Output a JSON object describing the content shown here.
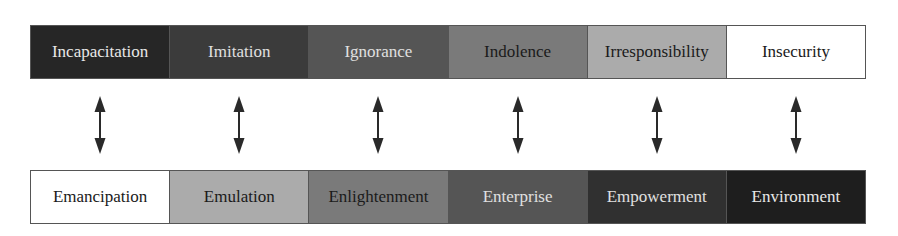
{
  "top_row": {
    "items": [
      {
        "label": "Incapacitation",
        "bg": "#262626",
        "fg": "#e8e8e8"
      },
      {
        "label": "Imitation",
        "bg": "#3b3b3b",
        "fg": "#e0e0e0"
      },
      {
        "label": "Ignorance",
        "bg": "#555555",
        "fg": "#e0e0e0"
      },
      {
        "label": "Indolence",
        "bg": "#7a7a7a",
        "fg": "#1a1a1a"
      },
      {
        "label": "Irresponsibility",
        "bg": "#ababab",
        "fg": "#1a1a1a"
      },
      {
        "label": "Insecurity",
        "bg": "#ffffff",
        "fg": "#1a1a1a"
      }
    ]
  },
  "bottom_row": {
    "items": [
      {
        "label": "Emancipation",
        "bg": "#ffffff",
        "fg": "#1a1a1a"
      },
      {
        "label": "Emulation",
        "bg": "#ababab",
        "fg": "#1a1a1a"
      },
      {
        "label": "Enlightenment",
        "bg": "#7a7a7a",
        "fg": "#1a1a1a"
      },
      {
        "label": "Enterprise",
        "bg": "#555555",
        "fg": "#e0e0e0"
      },
      {
        "label": "Empowerment",
        "bg": "#303030",
        "fg": "#e0e0e0"
      },
      {
        "label": "Environment",
        "bg": "#1e1e1e",
        "fg": "#e8e8e8"
      }
    ]
  },
  "connector": {
    "icon": "double-headed-vertical-arrow",
    "color": "#2a2a2a",
    "count": 6
  }
}
